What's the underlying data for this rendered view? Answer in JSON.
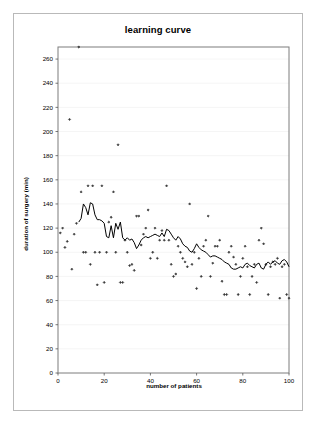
{
  "chart_data": {
    "type": "scatter",
    "title": "learning curve",
    "xlabel": "number of patients",
    "ylabel": "duration of surgery (min)",
    "xlim": [
      0,
      100
    ],
    "ylim": [
      0,
      270
    ],
    "xticks": [
      0,
      20,
      40,
      60,
      80,
      100
    ],
    "yticks": [
      0,
      20,
      40,
      60,
      80,
      100,
      120,
      140,
      160,
      180,
      200,
      220,
      240,
      260
    ],
    "grid": "horizontal-faint",
    "legend": "none",
    "marker": "small-diamond",
    "marker_color": "#3a3a3a",
    "line_color": "#000000",
    "series": [
      {
        "name": "duration of surgery",
        "type": "scatter",
        "x": [
          1,
          2,
          3,
          4,
          5,
          6,
          7,
          8,
          9,
          10,
          11,
          12,
          13,
          14,
          15,
          16,
          17,
          18,
          19,
          20,
          21,
          22,
          23,
          24,
          25,
          26,
          27,
          28,
          29,
          30,
          31,
          32,
          33,
          34,
          35,
          36,
          37,
          38,
          39,
          40,
          41,
          42,
          43,
          44,
          45,
          46,
          47,
          48,
          49,
          50,
          51,
          52,
          53,
          54,
          55,
          56,
          57,
          58,
          59,
          60,
          61,
          62,
          63,
          64,
          65,
          66,
          67,
          68,
          69,
          70,
          71,
          72,
          73,
          74,
          75,
          76,
          77,
          78,
          79,
          80,
          81,
          82,
          83,
          84,
          85,
          86,
          87,
          88,
          89,
          90,
          91,
          92,
          93,
          94,
          95,
          96,
          97,
          98,
          99,
          100
        ],
        "y": [
          116,
          120,
          104,
          109,
          210,
          86,
          115,
          124,
          270,
          150,
          100,
          100,
          155,
          90,
          155,
          100,
          73,
          100,
          155,
          75,
          100,
          125,
          129,
          150,
          100,
          189,
          75,
          75,
          110,
          100,
          89,
          90,
          85,
          130,
          130,
          106,
          115,
          120,
          135,
          95,
          100,
          120,
          95,
          110,
          118,
          110,
          155,
          110,
          90,
          80,
          82,
          105,
          100,
          95,
          92,
          88,
          140,
          90,
          100,
          70,
          95,
          80,
          105,
          110,
          130,
          80,
          91,
          105,
          105,
          110,
          76,
          65,
          65,
          100,
          105,
          96,
          90,
          65,
          80,
          95,
          105,
          88,
          65,
          80,
          90,
          75,
          110,
          120,
          107,
          90,
          65,
          88,
          92,
          90,
          95,
          62,
          88,
          90,
          65,
          62
        ]
      },
      {
        "name": "moving average",
        "type": "line",
        "x": [
          9,
          10,
          11,
          12,
          13,
          14,
          15,
          16,
          17,
          18,
          19,
          20,
          21,
          22,
          23,
          24,
          25,
          26,
          27,
          28,
          29,
          30,
          31,
          32,
          33,
          34,
          35,
          36,
          37,
          38,
          39,
          40,
          41,
          42,
          43,
          44,
          45,
          46,
          47,
          48,
          49,
          50,
          51,
          52,
          53,
          54,
          55,
          56,
          57,
          58,
          59,
          60,
          61,
          62,
          63,
          64,
          65,
          66,
          67,
          68,
          69,
          70,
          71,
          72,
          73,
          74,
          75,
          76,
          77,
          78,
          79,
          80,
          81,
          82,
          83,
          84,
          85,
          86,
          87,
          88,
          89,
          90,
          91,
          92,
          93,
          94,
          95,
          96,
          97,
          98,
          99,
          100
        ],
        "y": [
          125,
          128,
          140,
          137,
          131,
          141,
          140,
          131,
          127,
          127,
          126,
          124,
          113,
          112,
          122,
          112,
          124,
          119,
          125,
          112,
          110,
          112,
          110,
          111,
          108,
          103,
          106,
          110,
          112,
          113,
          112,
          113,
          114,
          115,
          114,
          113,
          116,
          113,
          119,
          118,
          115,
          112,
          110,
          113,
          111,
          107,
          105,
          104,
          101,
          100,
          103,
          107,
          104,
          102,
          101,
          100,
          98,
          96,
          97,
          97,
          96,
          95,
          94,
          92,
          91,
          90,
          87,
          86,
          86,
          87,
          88,
          87,
          90,
          91,
          89,
          88,
          87,
          90,
          91,
          87,
          86,
          90,
          92,
          90,
          92,
          93,
          91,
          90,
          93,
          94,
          92,
          88
        ]
      }
    ]
  }
}
